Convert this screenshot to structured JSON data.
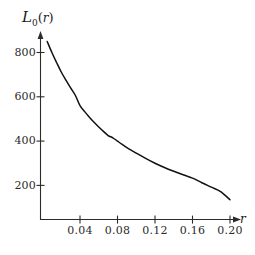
{
  "figure": {
    "background_color": "#ffffff",
    "line_color": "#111111",
    "axis_color": "#2b2b2b"
  },
  "axes": {
    "y_axis_title": {
      "symbol": "L",
      "subscript": "0",
      "open_paren": "(",
      "argument": "r",
      "close_paren": ")",
      "full": "L0(r)"
    },
    "x_axis_title": "r",
    "x_tick_labels": [
      "0.04",
      "0.08",
      "0.12",
      "0.16",
      "0.20"
    ],
    "y_tick_labels": [
      "800",
      "600",
      "400",
      "200"
    ]
  },
  "chart_data": {
    "type": "line",
    "title": "",
    "subtitle": "",
    "xlabel": "r",
    "ylabel": "L0(r)",
    "xlim": [
      0.0,
      0.215
    ],
    "ylim": [
      0,
      880
    ],
    "xticks": [
      0.04,
      0.08,
      0.12,
      0.16,
      0.2
    ],
    "yticks": [
      200,
      400,
      600,
      800
    ],
    "grid": false,
    "legend": null,
    "legend_position": "none",
    "annotations": [],
    "series": [
      {
        "name": "L0(r)",
        "color": "#111111",
        "x": [
          0.005,
          0.01,
          0.015,
          0.02,
          0.025,
          0.03,
          0.035,
          0.04,
          0.045,
          0.05,
          0.055,
          0.06,
          0.065,
          0.07,
          0.075,
          0.08,
          0.085,
          0.09,
          0.095,
          0.1,
          0.11,
          0.12,
          0.13,
          0.14,
          0.15,
          0.16,
          0.17,
          0.18,
          0.19,
          0.2
        ],
        "values": [
          850,
          800,
          755,
          712,
          675,
          640,
          607,
          560,
          533,
          508,
          485,
          464,
          444,
          425,
          415,
          400,
          385,
          371,
          358,
          346,
          322,
          300,
          281,
          264,
          248,
          233,
          212,
          192,
          172,
          135
        ]
      }
    ]
  }
}
